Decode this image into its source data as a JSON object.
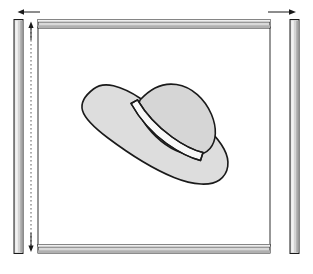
{
  "diagram": {
    "background_color": "#ffffff",
    "line_color": "#1a1a1a",
    "frame": {
      "name": "rectangular-frame",
      "rail_fill_light": "#e2e2e2",
      "rail_fill_dark": "#b4b4b4",
      "rail_stroke": "#1a1a1a",
      "inner_fill": "#ffffff",
      "top_rail": {
        "x": 38,
        "y": 19,
        "width": 232,
        "height": 9
      },
      "bottom_rail": {
        "x": 38,
        "y": 245,
        "width": 232,
        "height": 9
      },
      "inner_panel": {
        "x": 38,
        "y": 28,
        "width": 232,
        "height": 217
      },
      "left_post": {
        "x": 14,
        "y": 19,
        "width": 9,
        "height": 235
      },
      "right_post": {
        "x": 290,
        "y": 19,
        "width": 9,
        "height": 235
      }
    },
    "dimensions": [
      {
        "name": "top-left-width-arrow",
        "orientation": "horizontal",
        "direction": "left",
        "x1": 40,
        "x2": 18,
        "y": 12
      },
      {
        "name": "top-right-width-arrow",
        "orientation": "horizontal",
        "direction": "right",
        "x1": 268,
        "x2": 296,
        "y": 12
      },
      {
        "name": "left-height-arrow-top",
        "orientation": "vertical",
        "direction": "up",
        "x": 31,
        "y1": 40,
        "y2": 22
      },
      {
        "name": "left-height-arrow-bottom",
        "orientation": "vertical",
        "direction": "down",
        "x": 31,
        "y1": 232,
        "y2": 252
      },
      {
        "name": "left-extension-line",
        "orientation": "vertical",
        "x": 31,
        "y1": 22,
        "y2": 252
      }
    ],
    "hat": {
      "name": "wide-brim-hat",
      "brim_fill": "#dddddd",
      "crown_fill": "#d6d6d6",
      "band_fill": "#f7f7f7",
      "stripe_fill": "#cccccc",
      "stroke": "#1a1a1a",
      "tilt_description": "tilted diagonally from upper-left brim tip to lower-right brim",
      "band_stripe_count": 5
    },
    "watermarks": {
      "name": "floral-motif-pattern",
      "color": "#f4f4f4",
      "count": 14,
      "points": [
        {
          "x": 72,
          "y": 52,
          "s": 9
        },
        {
          "x": 120,
          "y": 88,
          "s": 7
        },
        {
          "x": 98,
          "y": 46,
          "s": 6
        },
        {
          "x": 155,
          "y": 36,
          "s": 8
        },
        {
          "x": 206,
          "y": 42,
          "s": 7
        },
        {
          "x": 247,
          "y": 58,
          "s": 9
        },
        {
          "x": 258,
          "y": 112,
          "s": 7
        },
        {
          "x": 240,
          "y": 164,
          "s": 8
        },
        {
          "x": 204,
          "y": 206,
          "s": 9
        },
        {
          "x": 148,
          "y": 212,
          "s": 7
        },
        {
          "x": 104,
          "y": 196,
          "s": 9
        },
        {
          "x": 64,
          "y": 168,
          "s": 7
        },
        {
          "x": 56,
          "y": 118,
          "s": 8
        },
        {
          "x": 180,
          "y": 232,
          "s": 7
        }
      ]
    }
  }
}
